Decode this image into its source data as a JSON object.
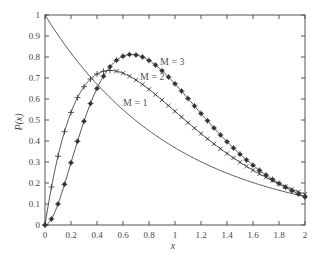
{
  "chart_data": {
    "type": "line",
    "title": "",
    "xlabel": "x",
    "ylabel": "P(x)",
    "xlim": [
      0,
      2
    ],
    "ylim": [
      0,
      1
    ],
    "grid": false,
    "xticks": [
      "0",
      "0.2",
      "0.4",
      "0.6",
      "0.8",
      "1",
      "1.2",
      "1.4",
      "1.6",
      "1.8",
      "2"
    ],
    "yticks": [
      "0",
      "0.1",
      "0.2",
      "0.3",
      "0.4",
      "0.5",
      "0.6",
      "0.7",
      "0.8",
      "0.9",
      "1"
    ],
    "x": [
      0,
      0.05,
      0.1,
      0.15,
      0.2,
      0.25,
      0.3,
      0.35,
      0.4,
      0.45,
      0.5,
      0.55,
      0.6,
      0.65,
      0.7,
      0.75,
      0.8,
      0.85,
      0.9,
      0.95,
      1.0,
      1.05,
      1.1,
      1.15,
      1.2,
      1.25,
      1.3,
      1.35,
      1.4,
      1.45,
      1.5,
      1.55,
      1.6,
      1.65,
      1.7,
      1.75,
      1.8,
      1.85,
      1.9,
      1.95,
      2.0
    ],
    "series": [
      {
        "name": "M = 1",
        "marker": "none",
        "values": [
          1.0,
          0.951,
          0.905,
          0.861,
          0.819,
          0.779,
          0.741,
          0.705,
          0.67,
          0.638,
          0.607,
          0.577,
          0.549,
          0.522,
          0.497,
          0.472,
          0.449,
          0.427,
          0.407,
          0.387,
          0.368,
          0.35,
          0.333,
          0.317,
          0.301,
          0.287,
          0.273,
          0.259,
          0.247,
          0.235,
          0.223,
          0.212,
          0.202,
          0.192,
          0.183,
          0.174,
          0.165,
          0.157,
          0.15,
          0.142,
          0.135
        ]
      },
      {
        "name": "M = 2",
        "marker": "+ / x",
        "values": [
          0.0,
          0.181,
          0.327,
          0.444,
          0.536,
          0.607,
          0.659,
          0.696,
          0.719,
          0.732,
          0.736,
          0.733,
          0.723,
          0.709,
          0.69,
          0.669,
          0.646,
          0.621,
          0.595,
          0.569,
          0.541,
          0.514,
          0.488,
          0.461,
          0.435,
          0.41,
          0.386,
          0.362,
          0.34,
          0.318,
          0.299,
          0.279,
          0.261,
          0.243,
          0.227,
          0.211,
          0.197,
          0.183,
          0.17,
          0.158,
          0.147
        ]
      },
      {
        "name": "M = 3",
        "marker": "asterisk",
        "values": [
          0.0,
          0.029,
          0.1,
          0.194,
          0.296,
          0.398,
          0.492,
          0.574,
          0.642,
          0.696,
          0.753,
          0.78,
          0.799,
          0.81,
          0.812,
          0.808,
          0.797,
          0.781,
          0.761,
          0.738,
          0.672,
          0.655,
          0.627,
          0.598,
          0.568,
          0.54,
          0.511,
          0.483,
          0.456,
          0.429,
          0.404,
          0.379,
          0.356,
          0.333,
          0.311,
          0.291,
          0.272,
          0.253,
          0.235,
          0.219,
          0.134
        ]
      }
    ],
    "annotations": [
      {
        "text": "M = 1",
        "x": 0.78,
        "y": 0.58
      },
      {
        "text": "M = 2",
        "x": 0.86,
        "y": 0.69
      },
      {
        "text": "M = 3",
        "x": 1.1,
        "y": 0.8
      }
    ]
  },
  "labels": {
    "xlabel": "x",
    "ylabel": "P(x)",
    "m1": "M = 1",
    "m2": "M = 2",
    "m3": "M = 3"
  }
}
